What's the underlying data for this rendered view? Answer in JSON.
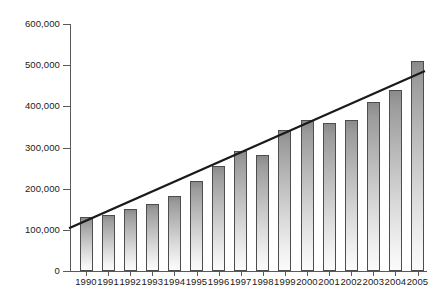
{
  "chart_data": {
    "type": "bar",
    "title": "",
    "subtitle": "",
    "xlabel": "",
    "ylabel": "",
    "grid": false,
    "legend": null,
    "ylim": [
      0,
      600000
    ],
    "ytick_values": [
      0,
      100000,
      200000,
      300000,
      400000,
      500000,
      600000
    ],
    "ytick_labels": [
      "0",
      "100,000",
      "200,000",
      "300,000",
      "400,000",
      "500,000",
      "600,000"
    ],
    "categories": [
      "1990",
      "1991",
      "1992",
      "1993",
      "1994",
      "1995",
      "1996",
      "1997",
      "1998",
      "1999",
      "2000",
      "2001",
      "2002",
      "2003",
      "2004",
      "2005"
    ],
    "values": [
      130000,
      135000,
      150000,
      162000,
      182000,
      218000,
      255000,
      292000,
      283000,
      343000,
      367000,
      360000,
      368000,
      410000,
      440000,
      510000
    ],
    "series": [
      {
        "name": "Bars",
        "type": "bar",
        "values": [
          130000,
          135000,
          150000,
          162000,
          182000,
          218000,
          255000,
          292000,
          283000,
          343000,
          367000,
          360000,
          368000,
          410000,
          440000,
          510000
        ]
      },
      {
        "name": "Trend line",
        "type": "line",
        "start_value": 105000,
        "end_value": 485000
      }
    ],
    "colors": {
      "bar_top": "#8a8a8a",
      "bar_bottom": "#fbfbfb",
      "bar_outline": "#4d4d4f",
      "axis": "#59595b",
      "trend_line": "#1a1a1a",
      "text": "#1a1a1a",
      "background": "#ffffff"
    }
  }
}
